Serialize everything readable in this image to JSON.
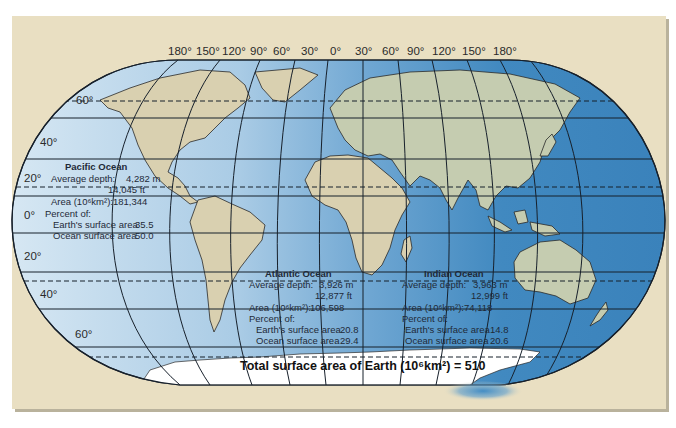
{
  "figure": {
    "longitude_labels": [
      "180°",
      "150°",
      "120°",
      "90°",
      "60°",
      "30°",
      "0°",
      "30°",
      "60°",
      "90°",
      "120°",
      "150°",
      "180°"
    ],
    "latitude_labels_left": [
      "60°",
      "40°",
      "20°",
      "0°",
      "20°",
      "40°",
      "60°"
    ],
    "colors": {
      "background": "#e9dfc2",
      "ocean_light": "#cfe3f1",
      "ocean_dark": "#3f86be",
      "land_west": "#d9d0b0",
      "land_east": "#c5ccb0",
      "antarctica": "#ffffff",
      "grid": "#17202b"
    }
  },
  "oceans": {
    "pacific": {
      "name": "Pacific Ocean",
      "depth_label": "Average depth:",
      "depth_m": "4,282 m",
      "depth_ft": "14,045 ft",
      "area_label": "Area (10⁶km²):",
      "area": "181,344",
      "percent_label": "Percent of:",
      "earth_label": "Earth's surface area",
      "earth_value": "35.5",
      "ocean_label": "Ocean surface area",
      "ocean_value": "50.0"
    },
    "atlantic": {
      "name": "Atlantic Ocean",
      "depth_label": "Average depth:",
      "depth_m": "3,926 m",
      "depth_ft": "12,877 ft",
      "area_label": "Area (10⁶km²):",
      "area": "106,598",
      "percent_label": "Percent of:",
      "earth_label": "Earth's surface area",
      "earth_value": "20.8",
      "ocean_label": "Ocean surface area",
      "ocean_value": "29.4"
    },
    "indian": {
      "name": "Indian Ocean",
      "depth_label": "Average depth:",
      "depth_m": "3,963 m",
      "depth_ft": "12,999 ft",
      "area_label": "Area (10⁶km²):",
      "area": "74,118",
      "percent_label": "Percent of:",
      "earth_label": "Earth's surface area",
      "earth_value": "14.8",
      "ocean_label": "Ocean surface area",
      "ocean_value": "20.6"
    }
  },
  "total": {
    "label": "Total surface area of Earth (10⁶km²) = 510"
  }
}
